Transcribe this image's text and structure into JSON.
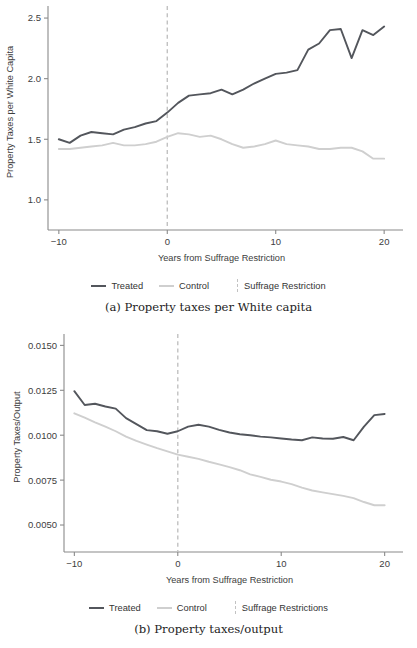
{
  "figure": {
    "panels": [
      {
        "id": "a",
        "caption": "(a) Property taxes per White capita",
        "legend": [
          {
            "label": "Treated",
            "style": "line",
            "color": "#53565c"
          },
          {
            "label": "Control",
            "style": "line",
            "color": "#cfcfcf"
          },
          {
            "label": "Suffrage Restriction",
            "style": "dashed",
            "color": "#c2c2c2"
          }
        ]
      },
      {
        "id": "b",
        "caption": "(b) Property taxes/output",
        "legend": [
          {
            "label": "Treated",
            "style": "line",
            "color": "#53565c"
          },
          {
            "label": "Control",
            "style": "line",
            "color": "#cfcfcf"
          },
          {
            "label": "Suffrage Restrictions",
            "style": "dashed",
            "color": "#c2c2c2"
          }
        ]
      }
    ]
  },
  "chart_data": [
    {
      "type": "line",
      "panel": "a",
      "title": "",
      "xlabel": "Years from Suffrage Restriction",
      "ylabel": "Property Taxes per White Capita",
      "xlim": [
        -11,
        21
      ],
      "ylim": [
        0.9,
        2.55
      ],
      "xticks": [
        -10,
        0,
        10,
        20
      ],
      "xtick_labels": [
        "-10",
        "0",
        "10",
        "20"
      ],
      "yticks": [
        1.0,
        1.5,
        2.0,
        2.5
      ],
      "ytick_labels": [
        "1.0",
        "1.5",
        "2.0",
        "2.5"
      ],
      "grid": false,
      "legend_position": "below",
      "annotations": [
        {
          "type": "vline",
          "x": 0,
          "label": "Suffrage Restriction",
          "style": "dashed",
          "color": "#c2c2c2"
        }
      ],
      "x": [
        -10,
        -9,
        -8,
        -7,
        -6,
        -5,
        -4,
        -3,
        -2,
        -1,
        0,
        1,
        2,
        3,
        4,
        5,
        6,
        7,
        8,
        9,
        10,
        11,
        12,
        13,
        14,
        15,
        16,
        17,
        18,
        19,
        20
      ],
      "series": [
        {
          "name": "Treated",
          "color": "#53565c",
          "values": [
            1.5,
            1.47,
            1.53,
            1.56,
            1.55,
            1.54,
            1.58,
            1.6,
            1.63,
            1.65,
            1.72,
            1.8,
            1.86,
            1.87,
            1.88,
            1.91,
            1.87,
            1.91,
            1.96,
            2.0,
            2.04,
            2.05,
            2.07,
            2.24,
            2.29,
            2.4,
            2.41,
            2.17,
            2.4,
            2.36,
            2.43
          ]
        },
        {
          "name": "Control",
          "color": "#cfcfcf",
          "values": [
            1.42,
            1.42,
            1.43,
            1.44,
            1.45,
            1.47,
            1.45,
            1.45,
            1.46,
            1.48,
            1.52,
            1.55,
            1.54,
            1.52,
            1.53,
            1.5,
            1.46,
            1.43,
            1.44,
            1.46,
            1.49,
            1.46,
            1.45,
            1.44,
            1.42,
            1.42,
            1.43,
            1.43,
            1.4,
            1.34,
            1.34
          ]
        }
      ]
    },
    {
      "type": "line",
      "panel": "b",
      "title": "",
      "xlabel": "Years from Suffrage Restriction",
      "ylabel": "Property Taxes/Output",
      "xlim": [
        -11,
        21
      ],
      "ylim": [
        0.0045,
        0.0153
      ],
      "xticks": [
        -10,
        0,
        10,
        20
      ],
      "xtick_labels": [
        "-10",
        "0",
        "10",
        "20"
      ],
      "yticks": [
        0.005,
        0.0075,
        0.01,
        0.0125,
        0.015
      ],
      "ytick_labels": [
        "0.0050",
        "0.0075",
        "0.0100",
        "0.0125",
        "0.0150"
      ],
      "grid": false,
      "legend_position": "below",
      "annotations": [
        {
          "type": "vline",
          "x": 0,
          "label": "Suffrage Restrictions",
          "style": "dashed",
          "color": "#c2c2c2"
        }
      ],
      "x": [
        -10,
        -9,
        -8,
        -7,
        -6,
        -5,
        -4,
        -3,
        -2,
        -1,
        0,
        1,
        2,
        3,
        4,
        5,
        6,
        7,
        8,
        9,
        10,
        11,
        12,
        13,
        14,
        15,
        16,
        17,
        18,
        19,
        20
      ],
      "series": [
        {
          "name": "Treated",
          "color": "#53565c",
          "values": [
            0.01245,
            0.01168,
            0.01175,
            0.0116,
            0.01148,
            0.01095,
            0.01062,
            0.01028,
            0.01022,
            0.01008,
            0.01022,
            0.01048,
            0.01058,
            0.01048,
            0.0103,
            0.01015,
            0.01005,
            0.01,
            0.00992,
            0.00988,
            0.00982,
            0.00976,
            0.00972,
            0.00988,
            0.00982,
            0.0098,
            0.0099,
            0.00972,
            0.01048,
            0.01112,
            0.01118
          ]
        },
        {
          "name": "Control",
          "color": "#cfcfcf",
          "values": [
            0.01122,
            0.01098,
            0.01072,
            0.01048,
            0.01022,
            0.00992,
            0.00968,
            0.00948,
            0.00928,
            0.0091,
            0.00892,
            0.0088,
            0.00868,
            0.00852,
            0.00838,
            0.00822,
            0.00805,
            0.00782,
            0.00768,
            0.00752,
            0.00742,
            0.00728,
            0.00708,
            0.00692,
            0.00682,
            0.00672,
            0.00662,
            0.0065,
            0.00628,
            0.0061,
            0.0061
          ]
        }
      ]
    }
  ]
}
